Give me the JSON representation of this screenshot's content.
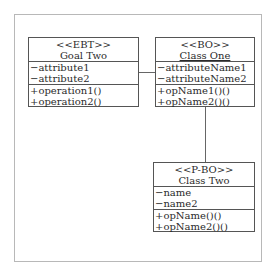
{
  "diagram": {
    "type": "UML class diagram",
    "classes": [
      {
        "id": "goal-two",
        "stereotype": "<<EBT>>",
        "name": "Goal Two",
        "attributes": [
          "−attribute1",
          "−attribute2"
        ],
        "operations": [
          "+operation1()",
          "+operation2()"
        ]
      },
      {
        "id": "class-one",
        "stereotype": "<<BO>>",
        "name": "Class One",
        "attributes": [
          "−attributeName1",
          "−attributeName2"
        ],
        "operations": [
          "+opName1()()",
          "+opName2()()"
        ]
      },
      {
        "id": "class-two",
        "stereotype": "<<P-BO>>",
        "name": "Class Two",
        "attributes": [
          "−name",
          "−name2"
        ],
        "operations": [
          "+opName()()",
          "+opName2()()"
        ]
      }
    ],
    "associations": [
      {
        "from": "goal-two",
        "to": "class-one"
      },
      {
        "from": "class-one",
        "to": "class-two"
      }
    ]
  }
}
